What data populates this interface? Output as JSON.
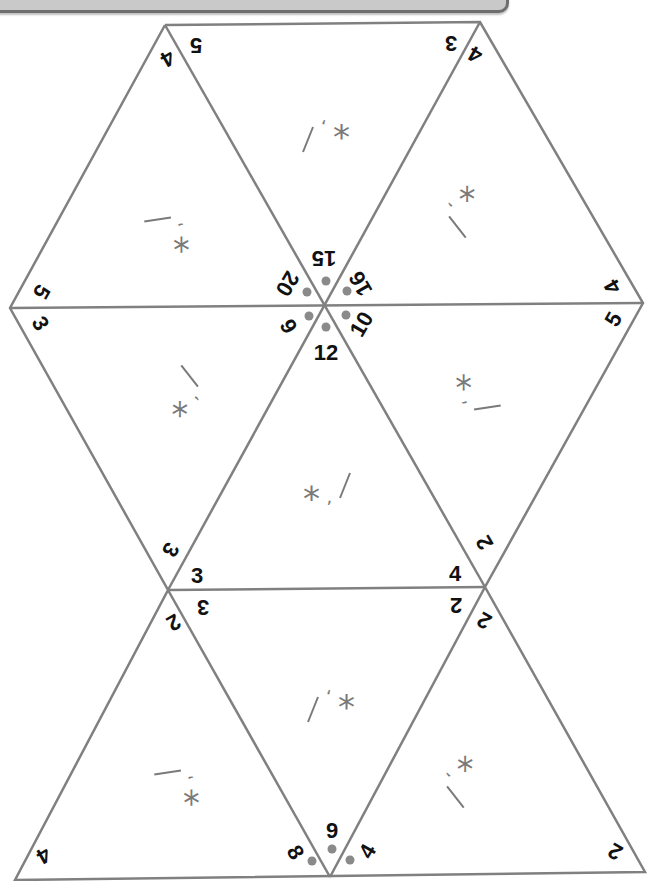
{
  "puzzle": {
    "colors": {
      "line": "#808080",
      "dot": "#8a8a8a",
      "label": "#111111",
      "symbol": "#7a7a7a",
      "header_bar": "#c9c9c9"
    },
    "center_numbers": [
      "15",
      "16",
      "10",
      "12",
      "9",
      "20"
    ],
    "bottom_center_numbers": [
      "8",
      "9",
      "4"
    ],
    "edge_labels": {
      "top_left_a": "5",
      "top_left_b": "4",
      "top_right_a": "3",
      "top_right_b": "4",
      "left_a": "5",
      "left_b": "3",
      "right_a": "4",
      "right_b": "5",
      "mid_left_a": "3",
      "mid_left_b": "3",
      "mid_left_c": "3",
      "mid_left_d": "2",
      "mid_right_a": "2",
      "mid_right_b": "4",
      "mid_right_c": "2",
      "mid_right_d": "2",
      "bottom_left": "4",
      "bottom_right": "2"
    },
    "triangle_symbols": [
      "/ ' *",
      "* , /",
      "— ' *",
      "* , —",
      "/ ' *",
      "* , /",
      "* , /",
      "— ' *",
      "/ ' *",
      "* , /"
    ]
  }
}
